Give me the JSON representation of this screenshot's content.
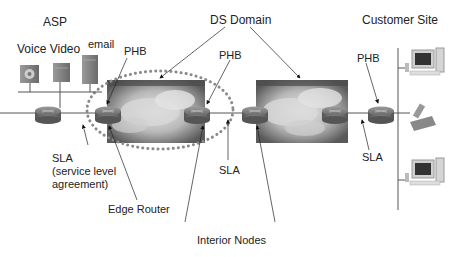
{
  "diagram": {
    "labels": {
      "asp": "ASP",
      "voice_video": "Voice Video",
      "email": "email",
      "ds_domain": "DS Domain",
      "customer_site": "Customer Site",
      "phb_left": "PHB",
      "phb_middle": "PHB",
      "phb_right": "PHB",
      "sla_left_line1": "SLA",
      "sla_left_line2": "(service level",
      "sla_left_line3": "agreement)",
      "sla_middle": "SLA",
      "sla_right": "SLA",
      "edge_router": "Edge Router",
      "interior_nodes": "Interior Nodes"
    },
    "nodes": {
      "asp_servers": [
        "voice-server",
        "video-server",
        "email-server"
      ],
      "customer_devices": [
        "computer",
        "phone",
        "computer"
      ],
      "ds_domains": 2
    },
    "colors": {
      "line": "#555555",
      "dotted_ellipse": "#8a8a8a",
      "router": "#7a7a7a",
      "cloud_dark": "#5a5a5a",
      "cloud_light": "#e0e0e0"
    }
  }
}
